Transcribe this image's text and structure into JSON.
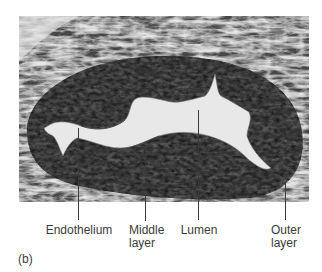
{
  "figure": {
    "panel_label": "(b)",
    "image_description": "Light micrograph cross-section of a blood vessel (artery) wall",
    "labels": {
      "endothelium": "Endothelium",
      "middle_layer_line1": "Middle",
      "middle_layer_line2": "layer",
      "lumen": "Lumen",
      "outer_layer_line1": "Outer",
      "outer_layer_line2": "layer"
    },
    "colors": {
      "tissue_dark": "#3c3c3c",
      "tissue_light": "#d9d9d9",
      "lumen": "#e6e6e6",
      "text": "#3b3b3b"
    }
  }
}
